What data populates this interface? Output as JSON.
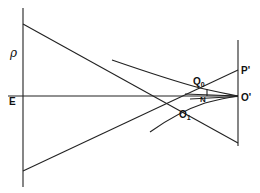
{
  "diagram": {
    "labels": {
      "rho": "ρ",
      "E": "E",
      "Q0_main": "Q",
      "Q0_sub": "0",
      "N": "N",
      "O1_main": "O",
      "O1_sub": "1",
      "P_prime": "P'",
      "O_prime": "O'"
    },
    "line_color": "#222222"
  }
}
